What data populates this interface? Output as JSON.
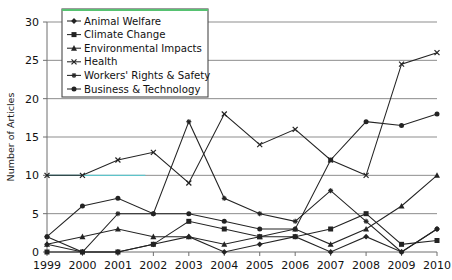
{
  "chart_data": {
    "type": "line",
    "title": "",
    "xlabel": "",
    "ylabel": "Number of Articles",
    "x": [
      1999,
      2000,
      2001,
      2002,
      2003,
      2004,
      2005,
      2006,
      2007,
      2008,
      2009,
      2010
    ],
    "xticklabels": [
      "1999",
      "2000",
      "2001",
      "2002",
      "2003",
      "2004",
      "2005",
      "2006",
      "2007",
      "2008",
      "2009",
      "2010"
    ],
    "yticklabels": [
      "0",
      "5",
      "10",
      "15",
      "20",
      "25",
      "30"
    ],
    "yticks": [
      0,
      5,
      10,
      15,
      20,
      25,
      30
    ],
    "ylim": [
      0,
      30
    ],
    "grid": "horizontal",
    "legend_position": "top-left inside",
    "series": [
      {
        "name": "Animal Welfare",
        "marker": "diamond",
        "values": [
          1,
          0,
          0,
          1,
          2,
          0,
          1,
          2,
          0,
          2,
          0,
          3
        ]
      },
      {
        "name": "Climate Change",
        "marker": "square",
        "values": [
          0,
          0,
          0,
          1,
          4,
          3,
          2,
          2,
          3,
          5,
          1,
          1.5
        ]
      },
      {
        "name": "Environmental Impacts",
        "marker": "triangle",
        "values": [
          1,
          2,
          3,
          2,
          2,
          1,
          2,
          3,
          1,
          3,
          6,
          10
        ]
      },
      {
        "name": "Health",
        "marker": "cross",
        "values": [
          10,
          10,
          12,
          13,
          9,
          18,
          14,
          16,
          12,
          10,
          24.5,
          26
        ]
      },
      {
        "name": "Workers' Rights & Safety",
        "marker": "star",
        "values": [
          2,
          0,
          5,
          5,
          17,
          7,
          5,
          4,
          8,
          4,
          0,
          3
        ]
      },
      {
        "name": "Business & Technology",
        "marker": "circle",
        "values": [
          2,
          6,
          7,
          5,
          5,
          4,
          3,
          3,
          12,
          17,
          16.5,
          18
        ]
      }
    ]
  },
  "legend": {
    "items": [
      {
        "label": "Animal Welfare"
      },
      {
        "label": "Climate Change"
      },
      {
        "label": "Environmental Impacts"
      },
      {
        "label": "Health"
      },
      {
        "label": "Workers' Rights & Safety"
      },
      {
        "label": "Business & Technology"
      }
    ]
  },
  "colors": {
    "line": "#232323",
    "grid": "#8d8d8d",
    "axis": "#6f6f6f",
    "legend_border": "#4a4a4a",
    "legend_top_accent": "#56c271",
    "highlight_line": "#5fc3c9"
  }
}
